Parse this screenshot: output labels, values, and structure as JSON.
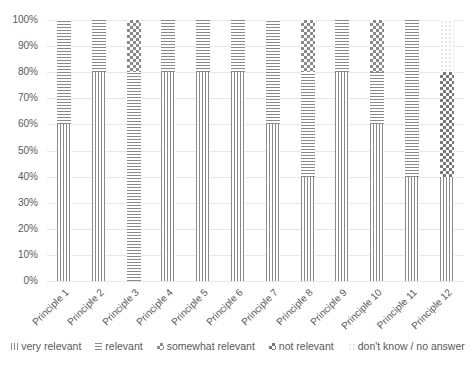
{
  "chart_data": {
    "type": "bar",
    "stacked": true,
    "percent": true,
    "title": "",
    "xlabel": "",
    "ylabel": "",
    "ylim": [
      0,
      100
    ],
    "y_ticks": [
      "0%",
      "10%",
      "20%",
      "30%",
      "40%",
      "50%",
      "60%",
      "70%",
      "80%",
      "90%",
      "100%"
    ],
    "grid": true,
    "legend_position": "bottom",
    "categories": [
      "Principle 1",
      "Principle 2",
      "Principle 3",
      "Principle 4",
      "Principle 5",
      "Principle 6",
      "Principle 7",
      "Principle 8",
      "Principle 9",
      "Principle 10",
      "Principle 11",
      "Principle 12"
    ],
    "series": [
      {
        "name": "very relevant",
        "pattern": "vertical-lines",
        "values": [
          60,
          80,
          0,
          80,
          80,
          80,
          60,
          40,
          80,
          60,
          40,
          40
        ]
      },
      {
        "name": "relevant",
        "pattern": "horizontal-lines",
        "values": [
          40,
          20,
          80,
          20,
          20,
          20,
          40,
          40,
          20,
          20,
          60,
          0
        ]
      },
      {
        "name": "somewhat relevant",
        "pattern": "checker",
        "values": [
          0,
          0,
          20,
          0,
          0,
          0,
          0,
          20,
          0,
          20,
          0,
          0
        ]
      },
      {
        "name": "not relevant",
        "pattern": "dense-checker",
        "values": [
          0,
          0,
          0,
          0,
          0,
          0,
          0,
          0,
          0,
          0,
          0,
          40
        ]
      },
      {
        "name": "don't know / no answer",
        "pattern": "dots",
        "values": [
          0,
          0,
          0,
          0,
          0,
          0,
          0,
          0,
          0,
          0,
          0,
          20
        ]
      }
    ]
  },
  "legend": {
    "items": [
      {
        "label": "very relevant",
        "cls": "p-very"
      },
      {
        "label": "relevant",
        "cls": "p-rel"
      },
      {
        "label": "somewhat relevant",
        "cls": "p-some"
      },
      {
        "label": "not relevant",
        "cls": "p-not"
      },
      {
        "label": "don't know / no answer",
        "cls": "p-dk"
      }
    ]
  },
  "colors": {
    "pattern_ink": "#8a8a8a",
    "grid": "#e6e6e6",
    "text": "#595959"
  }
}
